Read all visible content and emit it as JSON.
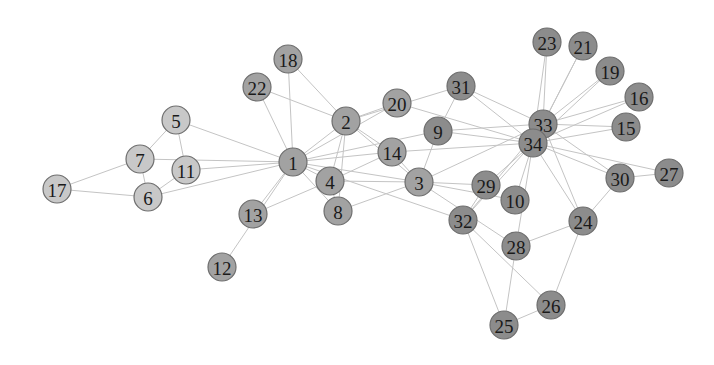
{
  "diagram": {
    "type": "network-graph",
    "node_radius": 14,
    "groups": {
      "light": {
        "color": "#c8c8c8"
      },
      "medium": {
        "color": "#a2a2a2"
      },
      "dark": {
        "color": "#8c8c8c"
      }
    },
    "nodes": [
      {
        "id": "1",
        "x": 293,
        "y": 162,
        "group": "medium"
      },
      {
        "id": "2",
        "x": 346,
        "y": 121,
        "group": "medium"
      },
      {
        "id": "3",
        "x": 419,
        "y": 182,
        "group": "medium"
      },
      {
        "id": "4",
        "x": 330,
        "y": 181,
        "group": "medium"
      },
      {
        "id": "5",
        "x": 176,
        "y": 120,
        "group": "light"
      },
      {
        "id": "6",
        "x": 148,
        "y": 197,
        "group": "light"
      },
      {
        "id": "7",
        "x": 140,
        "y": 159,
        "group": "light"
      },
      {
        "id": "8",
        "x": 338,
        "y": 211,
        "group": "medium"
      },
      {
        "id": "9",
        "x": 438,
        "y": 131,
        "group": "dark"
      },
      {
        "id": "10",
        "x": 515,
        "y": 200,
        "group": "dark"
      },
      {
        "id": "11",
        "x": 186,
        "y": 170,
        "group": "light"
      },
      {
        "id": "12",
        "x": 222,
        "y": 267,
        "group": "medium"
      },
      {
        "id": "13",
        "x": 253,
        "y": 214,
        "group": "medium"
      },
      {
        "id": "14",
        "x": 392,
        "y": 152,
        "group": "medium"
      },
      {
        "id": "15",
        "x": 626,
        "y": 127,
        "group": "dark"
      },
      {
        "id": "16",
        "x": 639,
        "y": 97,
        "group": "dark"
      },
      {
        "id": "17",
        "x": 57,
        "y": 189,
        "group": "light"
      },
      {
        "id": "18",
        "x": 288,
        "y": 59,
        "group": "medium"
      },
      {
        "id": "19",
        "x": 610,
        "y": 71,
        "group": "dark"
      },
      {
        "id": "20",
        "x": 397,
        "y": 103,
        "group": "medium"
      },
      {
        "id": "21",
        "x": 583,
        "y": 46,
        "group": "dark"
      },
      {
        "id": "22",
        "x": 257,
        "y": 87,
        "group": "medium"
      },
      {
        "id": "23",
        "x": 547,
        "y": 42,
        "group": "dark"
      },
      {
        "id": "24",
        "x": 583,
        "y": 221,
        "group": "dark"
      },
      {
        "id": "25",
        "x": 504,
        "y": 325,
        "group": "dark"
      },
      {
        "id": "26",
        "x": 551,
        "y": 305,
        "group": "dark"
      },
      {
        "id": "27",
        "x": 669,
        "y": 173,
        "group": "dark"
      },
      {
        "id": "28",
        "x": 516,
        "y": 246,
        "group": "dark"
      },
      {
        "id": "29",
        "x": 486,
        "y": 185,
        "group": "dark"
      },
      {
        "id": "30",
        "x": 620,
        "y": 178,
        "group": "dark"
      },
      {
        "id": "31",
        "x": 461,
        "y": 86,
        "group": "dark"
      },
      {
        "id": "32",
        "x": 463,
        "y": 220,
        "group": "dark"
      },
      {
        "id": "33",
        "x": 543,
        "y": 124,
        "group": "dark"
      },
      {
        "id": "34",
        "x": 533,
        "y": 143,
        "group": "dark"
      }
    ],
    "edges": [
      [
        "1",
        "2"
      ],
      [
        "1",
        "3"
      ],
      [
        "1",
        "4"
      ],
      [
        "1",
        "5"
      ],
      [
        "1",
        "6"
      ],
      [
        "1",
        "7"
      ],
      [
        "1",
        "8"
      ],
      [
        "1",
        "9"
      ],
      [
        "1",
        "11"
      ],
      [
        "1",
        "12"
      ],
      [
        "1",
        "13"
      ],
      [
        "1",
        "14"
      ],
      [
        "1",
        "18"
      ],
      [
        "1",
        "20"
      ],
      [
        "1",
        "22"
      ],
      [
        "1",
        "32"
      ],
      [
        "2",
        "3"
      ],
      [
        "2",
        "4"
      ],
      [
        "2",
        "8"
      ],
      [
        "2",
        "14"
      ],
      [
        "2",
        "18"
      ],
      [
        "2",
        "20"
      ],
      [
        "2",
        "22"
      ],
      [
        "2",
        "31"
      ],
      [
        "3",
        "4"
      ],
      [
        "3",
        "8"
      ],
      [
        "3",
        "9"
      ],
      [
        "3",
        "10"
      ],
      [
        "3",
        "14"
      ],
      [
        "3",
        "28"
      ],
      [
        "3",
        "29"
      ],
      [
        "3",
        "33"
      ],
      [
        "4",
        "8"
      ],
      [
        "4",
        "13"
      ],
      [
        "4",
        "14"
      ],
      [
        "5",
        "7"
      ],
      [
        "5",
        "11"
      ],
      [
        "6",
        "7"
      ],
      [
        "6",
        "11"
      ],
      [
        "6",
        "17"
      ],
      [
        "7",
        "17"
      ],
      [
        "9",
        "31"
      ],
      [
        "9",
        "33"
      ],
      [
        "9",
        "34"
      ],
      [
        "10",
        "34"
      ],
      [
        "14",
        "34"
      ],
      [
        "15",
        "33"
      ],
      [
        "15",
        "34"
      ],
      [
        "16",
        "33"
      ],
      [
        "16",
        "34"
      ],
      [
        "19",
        "33"
      ],
      [
        "19",
        "34"
      ],
      [
        "20",
        "34"
      ],
      [
        "21",
        "33"
      ],
      [
        "21",
        "34"
      ],
      [
        "23",
        "33"
      ],
      [
        "23",
        "34"
      ],
      [
        "24",
        "26"
      ],
      [
        "24",
        "28"
      ],
      [
        "24",
        "30"
      ],
      [
        "24",
        "33"
      ],
      [
        "24",
        "34"
      ],
      [
        "25",
        "26"
      ],
      [
        "25",
        "28"
      ],
      [
        "25",
        "32"
      ],
      [
        "26",
        "32"
      ],
      [
        "27",
        "30"
      ],
      [
        "27",
        "34"
      ],
      [
        "28",
        "34"
      ],
      [
        "29",
        "32"
      ],
      [
        "29",
        "34"
      ],
      [
        "30",
        "33"
      ],
      [
        "30",
        "34"
      ],
      [
        "31",
        "33"
      ],
      [
        "31",
        "34"
      ],
      [
        "32",
        "33"
      ],
      [
        "32",
        "34"
      ],
      [
        "33",
        "34"
      ]
    ]
  }
}
